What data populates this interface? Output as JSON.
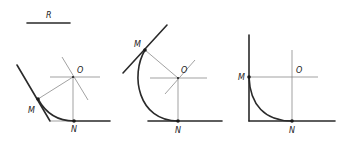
{
  "diagram": {
    "radius_label": "R",
    "figures": [
      {
        "id": "acute-angle",
        "labels": {
          "center": "O",
          "tangent_point_1": "M",
          "tangent_point_2": "N"
        }
      },
      {
        "id": "obtuse-angle",
        "labels": {
          "center": "O",
          "tangent_point_1": "M",
          "tangent_point_2": "N"
        }
      },
      {
        "id": "right-angle",
        "labels": {
          "center": "O",
          "tangent_point_1": "M",
          "tangent_point_2": "N"
        }
      }
    ],
    "colors": {
      "line": "#2a2a2a",
      "construction": "#7a7a7a",
      "background": "#ffffff"
    }
  }
}
